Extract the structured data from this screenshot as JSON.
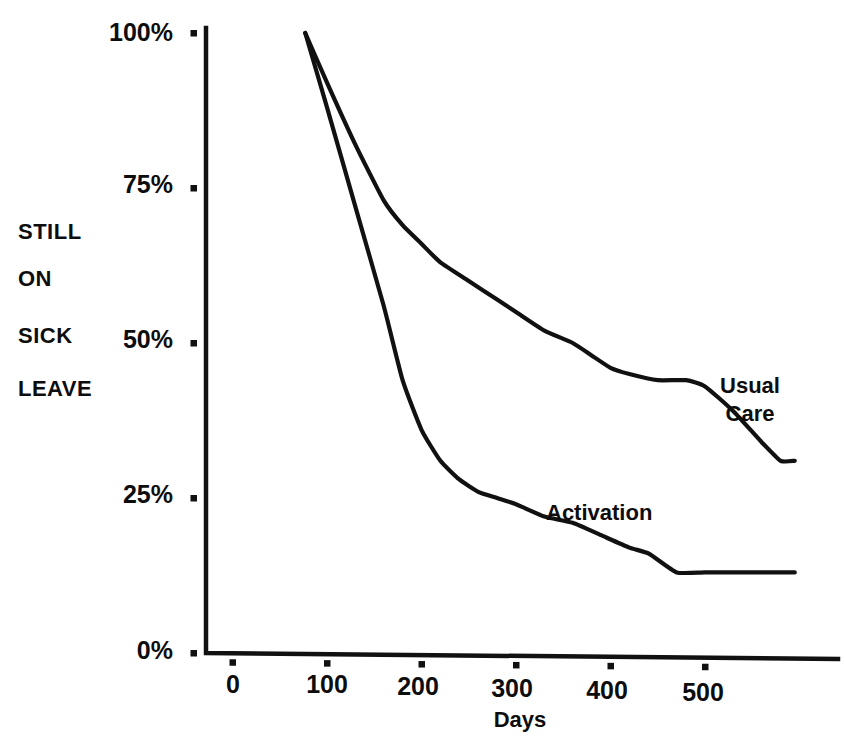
{
  "chart_data": {
    "type": "line",
    "title": "",
    "xlabel": "Days",
    "ylabel": "STILL ON SICK LEAVE",
    "ylabel_lines": [
      "STILL",
      "ON",
      "SICK",
      "LEAVE"
    ],
    "xlim": [
      -25,
      655
    ],
    "ylim": [
      0,
      100
    ],
    "x_ticks": [
      0,
      100,
      200,
      300,
      400,
      500
    ],
    "x_tick_labels": [
      "0",
      "100",
      "200",
      "300",
      "400",
      "500"
    ],
    "y_ticks": [
      0,
      25,
      50,
      75,
      100
    ],
    "y_tick_labels": [
      "0%",
      "25%",
      "50%",
      "75%",
      "100%"
    ],
    "grid": false,
    "legend_position": "inline-annotation",
    "line_color": "#111111",
    "axis_color": "#111111",
    "series": [
      {
        "name": "Usual Care",
        "label": "Usual Care",
        "label_lines": [
          "Usual",
          "Care"
        ],
        "x": [
          77,
          100,
          130,
          160,
          180,
          200,
          220,
          250,
          280,
          300,
          330,
          360,
          380,
          400,
          420,
          450,
          480,
          500,
          530,
          560,
          580,
          595
        ],
        "y": [
          100,
          92,
          82,
          73,
          69,
          66,
          63,
          60,
          57,
          55,
          52,
          50,
          48,
          46,
          45,
          44,
          44,
          43,
          39,
          34,
          31,
          31
        ]
      },
      {
        "name": "Activation",
        "label": "Activation",
        "label_lines": [
          "Activation"
        ],
        "x": [
          77,
          100,
          130,
          160,
          180,
          200,
          220,
          240,
          260,
          280,
          300,
          330,
          360,
          390,
          420,
          441,
          470,
          500,
          540,
          570,
          595
        ],
        "y": [
          100,
          88,
          72,
          56,
          44,
          36,
          31,
          28,
          26,
          25,
          24,
          22,
          21,
          19,
          17,
          16,
          13,
          13,
          13,
          13,
          13
        ]
      }
    ]
  },
  "axes": {
    "y_axis_name": "y-axis",
    "x_axis_name": "x-axis"
  }
}
